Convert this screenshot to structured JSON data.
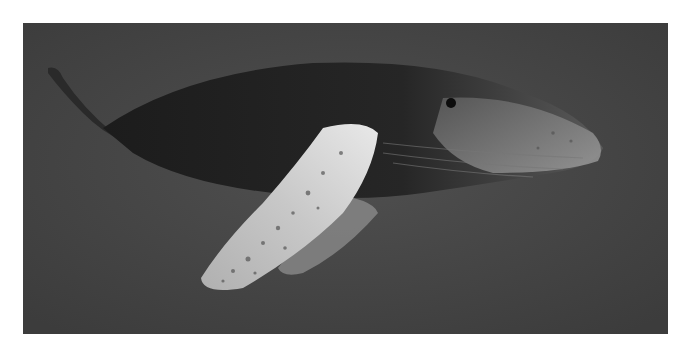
{
  "image": {
    "subject": "humpback whale",
    "description": "Grayscale underwater photo of a humpback whale swimming left-to-right with its long pectoral fin extended downward",
    "colors": {
      "water": "#4a4a4a",
      "body": "#202020",
      "fin": "#d8d8d8",
      "fin_shadow": "#8a8a8a",
      "head_highlight": "#9a9a9a"
    }
  }
}
